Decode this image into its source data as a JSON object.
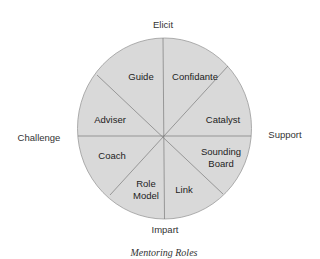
{
  "diagram": {
    "caption": "Mentoring Roles",
    "axes": {
      "top": "Elicit",
      "bottom": "Impart",
      "left": "Challenge",
      "right": "Support"
    },
    "segments": [
      {
        "label_lines": [
          "Guide"
        ]
      },
      {
        "label_lines": [
          "Confidante"
        ]
      },
      {
        "label_lines": [
          "Catalyst"
        ]
      },
      {
        "label_lines": [
          "Sounding",
          "Board"
        ]
      },
      {
        "label_lines": [
          "Link"
        ]
      },
      {
        "label_lines": [
          "Role",
          "Model"
        ]
      },
      {
        "label_lines": [
          "Coach"
        ]
      },
      {
        "label_lines": [
          "Adviser"
        ]
      }
    ],
    "colors": {
      "fill": "#d9d9d9",
      "stroke": "#8c8c8c",
      "divider": "#7a7a7a"
    }
  }
}
